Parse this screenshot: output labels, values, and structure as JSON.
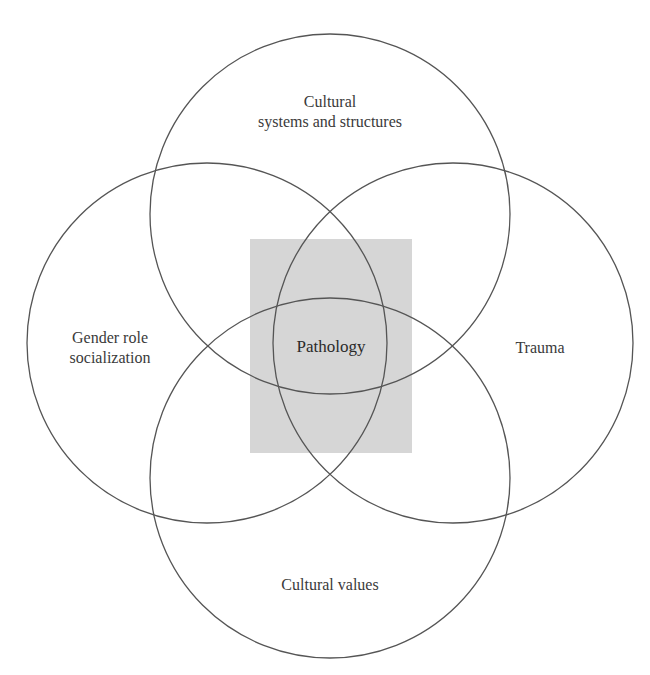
{
  "diagram": {
    "type": "venn",
    "colors": {
      "stroke": "#555555",
      "center_fill": "#d6d6d6",
      "text": "#3a3a3a"
    },
    "center": {
      "label": "Pathology"
    },
    "circles": [
      {
        "id": "top",
        "lines": [
          "Cultural",
          "systems and structures"
        ]
      },
      {
        "id": "left",
        "lines": [
          "Gender role",
          "socialization"
        ]
      },
      {
        "id": "right",
        "lines": [
          "Trauma"
        ]
      },
      {
        "id": "bottom",
        "lines": [
          "Cultural values"
        ]
      }
    ]
  }
}
